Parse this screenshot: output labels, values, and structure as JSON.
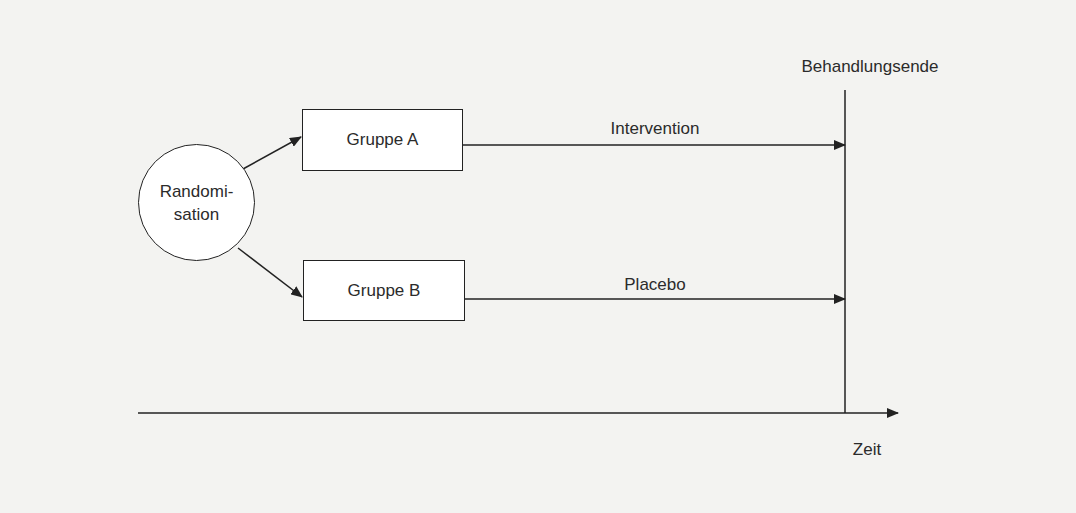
{
  "diagram": {
    "type": "study-design-flow",
    "start_node": {
      "line1": "Randomi-",
      "line2": "sation"
    },
    "groups": [
      {
        "label": "Gruppe A",
        "arm_label": "Intervention"
      },
      {
        "label": "Gruppe B",
        "arm_label": "Placebo"
      }
    ],
    "end_marker": "Behandlungsende",
    "time_axis_label": "Zeit"
  },
  "colors": {
    "background": "#f3f3f1",
    "stroke": "#222222",
    "text": "#2b2b2b",
    "box_fill": "#ffffff"
  }
}
